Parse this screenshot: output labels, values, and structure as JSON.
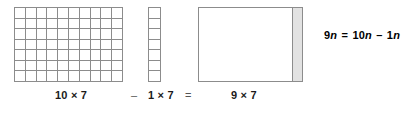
{
  "diagram": {
    "figures": [
      {
        "name": "grid-10x7",
        "label": "10 × 7",
        "columns": 10,
        "rows": 7,
        "cell_count": 70,
        "line_color": "#8c8c8c",
        "fill_color": "#ffffff"
      },
      {
        "name": "grid-1x7",
        "label": "1 × 7",
        "columns": 1,
        "rows": 7,
        "cell_count": 7,
        "line_color": "#8c8c8c",
        "fill_color": "#ffffff"
      },
      {
        "name": "rect-9x7",
        "label": "9 × 7",
        "columns": 9,
        "rows": 7,
        "cell_count": 63,
        "line_color": "#8c8c8c",
        "fill_color": "#ffffff",
        "shaded_strip_color": "#e2e2e2"
      }
    ],
    "caption": {
      "term_1": "10 × 7",
      "operator_minus": "–",
      "term_2": "1 × 7",
      "operator_equals": "=",
      "term_3": "9 × 7"
    },
    "equation": {
      "full_text": "9n = 10n – 1n",
      "left_coefficient": "9",
      "left_variable": "n",
      "equals": "=",
      "right_first_coefficient": "10",
      "right_first_variable": "n",
      "minus": "–",
      "right_second_coefficient": "1",
      "right_second_variable": "n"
    }
  },
  "chart_data": {
    "type": "table",
    "categories": [
      "10 × 7",
      "1 × 7",
      "9 × 7"
    ],
    "values": [
      70,
      7,
      63
    ],
    "xlabel": "",
    "ylabel": "",
    "grid": true,
    "legend": "none"
  }
}
